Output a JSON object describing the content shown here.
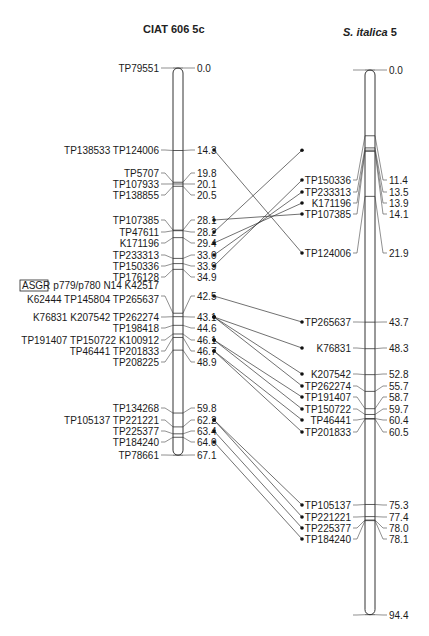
{
  "chart_data": {
    "type": "genetic_linkage_map_comparison",
    "scale_px_per_cM": 5.77,
    "left": {
      "title": "CIAT 606 5c",
      "length_cM": 67.1,
      "loci": [
        {
          "names": "TP79551",
          "pos": 0.0
        },
        {
          "names": "TP138533 TP124006",
          "pos": 14.3
        },
        {
          "names": "TP5707",
          "pos": 19.8
        },
        {
          "names": "TP107933",
          "pos": 20.1
        },
        {
          "names": "TP138855",
          "pos": 20.5
        },
        {
          "names": "TP107385",
          "pos": 28.1
        },
        {
          "names": "TP47611",
          "pos": 28.2
        },
        {
          "names": "K171196",
          "pos": 29.4
        },
        {
          "names": "TP233313",
          "pos": 33.0
        },
        {
          "names": "TP150336",
          "pos": 33.9
        },
        {
          "names": "TP176128",
          "pos": 34.9
        },
        {
          "names": "p779/p780 N14 K42517",
          "boxed_prefix": "ASGR",
          "pos": 42.5,
          "line2": "K62444 TP145804 TP265637"
        },
        {
          "names": "K76831 K207542 TP262274",
          "pos": 43.1
        },
        {
          "names": "TP198418",
          "pos": 44.6
        },
        {
          "names": "TP191407 TP150722 K100912",
          "pos": 46.1
        },
        {
          "names": "TP46441 TP201833",
          "pos": 46.7
        },
        {
          "names": "TP208225",
          "pos": 48.9
        },
        {
          "names": "TP134268",
          "pos": 59.8
        },
        {
          "names": "TP105137 TP221221",
          "pos": 62.2
        },
        {
          "names": "TP225377",
          "pos": 63.4
        },
        {
          "names": "TP184240",
          "pos": 64.0
        },
        {
          "names": "TP78661",
          "pos": 67.1
        }
      ]
    },
    "right": {
      "title_italic": "S. italica",
      "title_suffix": " 5",
      "length_cM": 94.4,
      "loci": [
        {
          "names": "",
          "pos": 0.0
        },
        {
          "names": "TP150336",
          "pos": 11.4
        },
        {
          "names": "TP233313",
          "pos": 13.5
        },
        {
          "names": "K171196",
          "pos": 13.9
        },
        {
          "names": "TP107385",
          "pos": 14.1
        },
        {
          "names": "TP124006",
          "pos": 21.9
        },
        {
          "names": "TP265637",
          "pos": 43.7
        },
        {
          "names": "K76831",
          "pos": 48.3
        },
        {
          "names": "K207542",
          "pos": 52.8
        },
        {
          "names": "TP262274",
          "pos": 55.7
        },
        {
          "names": "TP191407",
          "pos": 58.7
        },
        {
          "names": "TP150722",
          "pos": 59.7
        },
        {
          "names": "TP46441",
          "pos": 60.4
        },
        {
          "names": "TP201833",
          "pos": 60.5
        },
        {
          "names": "TP105137",
          "pos": 75.3
        },
        {
          "names": "TP221221",
          "pos": 77.4
        },
        {
          "names": "TP225377",
          "pos": 78.0
        },
        {
          "names": "TP184240",
          "pos": 78.1
        },
        {
          "names": "",
          "pos": 94.4
        }
      ]
    },
    "connections": [
      {
        "marker": "TP124006",
        "left": 14.3,
        "right": 21.9
      },
      {
        "marker": "TP107385",
        "left": 28.1,
        "right": 14.1
      },
      {
        "marker": "TP47611",
        "left": 28.2,
        "right": 13.9
      },
      {
        "marker": "K171196",
        "left": 29.4,
        "right": 13.9
      },
      {
        "marker": "TP233313",
        "left": 33.0,
        "right": 13.5
      },
      {
        "marker": "TP150336",
        "left": 33.9,
        "right": 11.4
      },
      {
        "marker": "TP265637",
        "left": 42.5,
        "right": 43.7
      },
      {
        "marker": "K76831",
        "left": 43.1,
        "right": 48.3
      },
      {
        "marker": "K207542",
        "left": 43.1,
        "right": 52.8
      },
      {
        "marker": "TP262274",
        "left": 43.1,
        "right": 55.7
      },
      {
        "marker": "TP191407",
        "left": 46.1,
        "right": 58.7
      },
      {
        "marker": "TP150722",
        "left": 46.1,
        "right": 59.7
      },
      {
        "marker": "TP46441",
        "left": 46.7,
        "right": 60.4
      },
      {
        "marker": "TP201833",
        "left": 46.7,
        "right": 60.5
      },
      {
        "marker": "TP105137",
        "left": 62.2,
        "right": 75.3
      },
      {
        "marker": "TP221221",
        "left": 62.2,
        "right": 77.4
      },
      {
        "marker": "TP225377",
        "left": 63.4,
        "right": 78.0
      },
      {
        "marker": "TP184240",
        "left": 64.0,
        "right": 78.1
      }
    ]
  }
}
